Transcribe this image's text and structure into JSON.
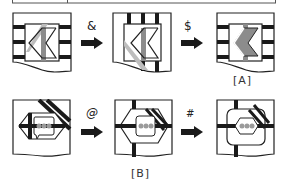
{
  "diagram": {
    "rows": [
      {
        "id": "row-top",
        "operations": [
          "&",
          "$"
        ],
        "result_label": "[A]"
      },
      {
        "id": "row-bottom",
        "operations": [
          "@",
          "#"
        ],
        "result_label": "[B]"
      }
    ],
    "arrow_icon": "right-arrow-icon",
    "colors": {
      "stroke": "#222222",
      "stripe": "#1a1a1a",
      "gray_bar": "#8c8c8c",
      "light_gray": "#bdbdbd",
      "dots": "#9a9a9a",
      "background": "#ffffff"
    }
  }
}
